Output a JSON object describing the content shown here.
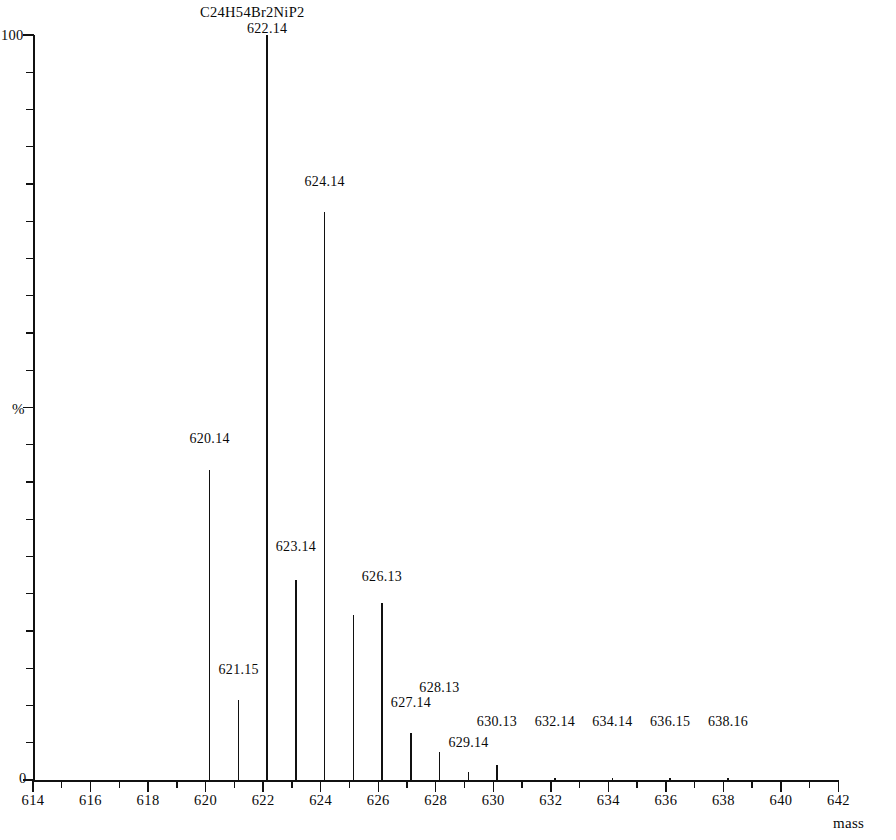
{
  "chart_data": {
    "type": "bar",
    "title": "C24H54Br2NiP2",
    "subtitle": "",
    "xlabel": "mass",
    "ylabel": "%",
    "xlim": [
      614,
      642
    ],
    "ylim": [
      0,
      100
    ],
    "grid": false,
    "legend": "none",
    "y_axis_ticks": [
      {
        "value": 100,
        "label": "100"
      },
      {
        "value": 50,
        "label": "%"
      },
      {
        "value": 0,
        "label": "0"
      }
    ],
    "y_minor_tick_step": 5,
    "x_axis_ticks": [
      {
        "value": 614,
        "label": "614"
      },
      {
        "value": 615,
        "label": ""
      },
      {
        "value": 616,
        "label": "616"
      },
      {
        "value": 617,
        "label": ""
      },
      {
        "value": 618,
        "label": "618"
      },
      {
        "value": 619,
        "label": ""
      },
      {
        "value": 620,
        "label": "620"
      },
      {
        "value": 621,
        "label": ""
      },
      {
        "value": 622,
        "label": "622"
      },
      {
        "value": 623,
        "label": ""
      },
      {
        "value": 624,
        "label": "624"
      },
      {
        "value": 625,
        "label": ""
      },
      {
        "value": 626,
        "label": "626"
      },
      {
        "value": 627,
        "label": ""
      },
      {
        "value": 628,
        "label": "628"
      },
      {
        "value": 629,
        "label": ""
      },
      {
        "value": 630,
        "label": "630"
      },
      {
        "value": 631,
        "label": ""
      },
      {
        "value": 632,
        "label": "632"
      },
      {
        "value": 633,
        "label": ""
      },
      {
        "value": 634,
        "label": "634"
      },
      {
        "value": 635,
        "label": ""
      },
      {
        "value": 636,
        "label": "636"
      },
      {
        "value": 637,
        "label": ""
      },
      {
        "value": 638,
        "label": "638"
      },
      {
        "value": 639,
        "label": ""
      },
      {
        "value": 640,
        "label": "640"
      },
      {
        "value": 641,
        "label": ""
      },
      {
        "value": 642,
        "label": "642"
      }
    ],
    "x": [
      620.14,
      621.15,
      622.14,
      623.14,
      624.14,
      625.14,
      626.13,
      627.14,
      628.13,
      629.14,
      630.13,
      632.14,
      634.14,
      636.15,
      638.16
    ],
    "values": [
      41.6,
      10.7,
      100.0,
      26.8,
      76.2,
      22.1,
      23.8,
      6.3,
      3.8,
      1.1,
      2.0,
      0.3,
      0.3,
      0.3,
      0.3
    ],
    "point_labels": [
      "620.14",
      "621.15",
      "622.14",
      "623.14",
      "624.14",
      "",
      "626.13",
      "627.14",
      "628.13",
      "629.14",
      "630.13",
      "632.14",
      "634.14",
      "636.15",
      "638.16"
    ],
    "label_y_percent": [
      45.0,
      14.0,
      100.0,
      30.5,
      79.5,
      0,
      26.5,
      9.5,
      11.5,
      4.2,
      7.0,
      7.0,
      7.0,
      7.0,
      7.0
    ]
  }
}
